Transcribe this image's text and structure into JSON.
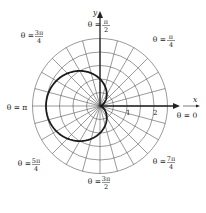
{
  "chart_data": {
    "type": "line",
    "coordinate_system": "polar",
    "title": "",
    "equation": "r = 1 - cos(theta)",
    "series": [
      {
        "name": "cardioid",
        "function": "1 - cos(theta)",
        "theta_range": [
          0,
          6.283185307
        ],
        "color": "#1a1a1a"
      }
    ],
    "r_grid": [
      0.5,
      1,
      1.5,
      2,
      2.5
    ],
    "theta_grid_step_degrees": 15,
    "r_tick_labels": [
      "1",
      "2"
    ],
    "r_ticks": [
      1,
      2
    ],
    "xlabel": "x",
    "ylabel": "y",
    "grid": true,
    "angle_labels": [
      {
        "angle_deg": 0,
        "prefix": "θ = ",
        "num": "0",
        "den": ""
      },
      {
        "angle_deg": 45,
        "prefix": "θ = ",
        "num": "π",
        "den": "4"
      },
      {
        "angle_deg": 90,
        "prefix": "θ = ",
        "num": "π",
        "den": "2"
      },
      {
        "angle_deg": 135,
        "prefix": "θ = ",
        "num": "3π",
        "den": "4"
      },
      {
        "angle_deg": 180,
        "prefix": "θ = ",
        "num": "π",
        "den": ""
      },
      {
        "angle_deg": 225,
        "prefix": "θ = ",
        "num": "5π",
        "den": "4"
      },
      {
        "angle_deg": 270,
        "prefix": "θ = ",
        "num": "3π",
        "den": "2"
      },
      {
        "angle_deg": 315,
        "prefix": "θ = ",
        "num": "7π",
        "den": "4"
      }
    ]
  }
}
